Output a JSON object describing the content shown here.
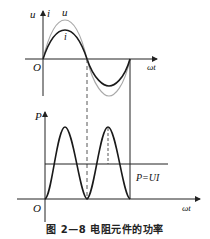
{
  "figure": {
    "caption": "图 2—8   电阻元件的功率",
    "top_plot": {
      "y_axis_label_u": "u",
      "y_axis_label_i": "i",
      "curve_label_u": "u",
      "curve_label_i": "i",
      "origin_label": "O",
      "x_axis_label": "ωt"
    },
    "bottom_plot": {
      "y_axis_label": "P",
      "origin_label": "O",
      "x_axis_label": "ωt",
      "average_line_label": "P=UI"
    },
    "colors": {
      "current_curve": "#1a1a1a",
      "voltage_curve": "#a8a8a8",
      "axes": "#222222"
    }
  }
}
